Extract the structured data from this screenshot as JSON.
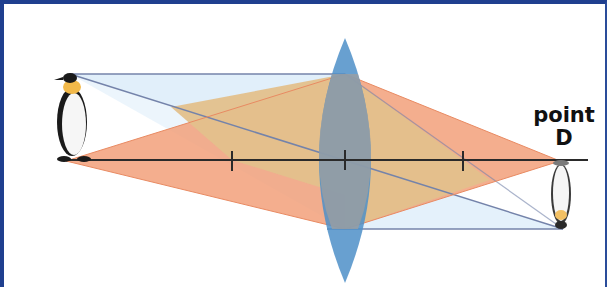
{
  "diagram": {
    "type": "convex-lens-ray-diagram",
    "labels": {
      "point_line1": "point",
      "point_line2": "D"
    },
    "elements": {
      "object": "upright penguin (object)",
      "image": "inverted penguin (image)",
      "lens": "convex lens",
      "optical_axis": "principal axis with focal point tick marks",
      "tick_marks": 3
    },
    "colors": {
      "border": "#1f3f8f",
      "ray_box_fill": "#dfeefa",
      "ray_line": "#6f7fa6",
      "cone_fill": "#f2a07a",
      "overlap_fill": "#e3c08c",
      "lens_fill": "#4d8fc8",
      "axis": "#2a2a2a"
    }
  }
}
